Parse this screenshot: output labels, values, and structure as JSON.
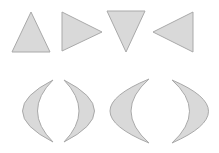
{
  "style": {
    "background": "#ffffff",
    "fill": "#d9d9d9",
    "stroke": "#a9a9a9"
  },
  "rows": [
    {
      "name": "triangles",
      "shapes": [
        {
          "id": "triangle-up",
          "kind": "triangle",
          "direction": "up",
          "points": "31,12 50,52 12,52"
        },
        {
          "id": "triangle-right",
          "kind": "triangle",
          "direction": "right",
          "points": "62,12 102,32 62,51"
        },
        {
          "id": "triangle-down",
          "kind": "triangle",
          "direction": "down",
          "points": "107,11 145,11 126,52"
        },
        {
          "id": "triangle-left",
          "kind": "triangle",
          "direction": "left",
          "points": "193,12 193,52 153,32"
        }
      ]
    },
    {
      "name": "crescents",
      "shapes": [
        {
          "id": "crescent-left-1",
          "kind": "crescent",
          "direction": "left",
          "d": "M53,80 Q-8,111 53,142 Q22,111 53,80 Z"
        },
        {
          "id": "crescent-right-1",
          "kind": "crescent",
          "direction": "right",
          "d": "M64,80 Q125,111 64,142 Q94,111 64,80 Z"
        },
        {
          "id": "crescent-left-2",
          "kind": "crescent",
          "direction": "left",
          "d": "M149,79 Q71,111 149,143 Q113,111 149,79 Z"
        },
        {
          "id": "crescent-right-2",
          "kind": "crescent",
          "direction": "right",
          "d": "M172,80 Q245,111 172,143 Q207,111 172,80 Z"
        }
      ]
    }
  ]
}
